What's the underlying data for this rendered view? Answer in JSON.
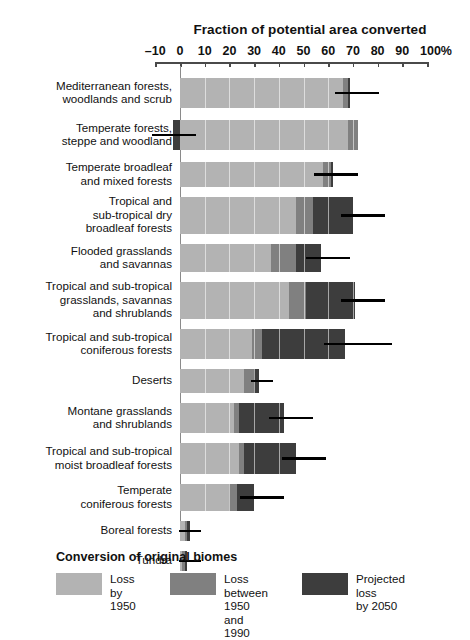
{
  "chart_data": {
    "type": "bar",
    "orientation": "horizontal",
    "stacked": true,
    "title": "Fraction of potential area converted",
    "xlabel": "",
    "ylabel": "",
    "xlim": [
      -10,
      100
    ],
    "xtick_labels": [
      "–10",
      "0",
      "10",
      "20",
      "30",
      "40",
      "50",
      "60",
      "70",
      "80",
      "90",
      "100%"
    ],
    "xtick_values": [
      -10,
      0,
      10,
      20,
      30,
      40,
      50,
      60,
      70,
      80,
      90,
      100
    ],
    "grid": false,
    "legend_position": "bottom",
    "legend_title": "Conversion of original biomes",
    "series": [
      {
        "name": "Loss by\n1950",
        "color": "#b3b3b3",
        "values": [
          66,
          68,
          58,
          47,
          37,
          44,
          29,
          26,
          22,
          24,
          20,
          2,
          1
        ]
      },
      {
        "name": "Loss between\n1950 and 1990",
        "color": "#808080",
        "values": [
          2,
          4,
          3,
          7,
          10,
          7,
          4,
          4,
          2,
          2,
          3,
          1,
          1
        ]
      },
      {
        "name": "Projected loss\nby 2050",
        "color": "#3d3d3d",
        "values": [
          1,
          -3,
          1,
          16,
          10,
          20,
          34,
          2,
          18,
          21,
          7,
          1,
          1
        ]
      }
    ],
    "categories": [
      "Mediterranean forests,\nwoodlands and scrub",
      "Temperate forests,\nsteppe and woodland",
      "Temperate broadleaf\nand mixed forests",
      "Tropical and\nsub-tropical dry\nbroadleaf forests",
      "Flooded grasslands\nand savannas",
      "Tropical and sub-tropical\ngrasslands, savannas\nand shrublands",
      "Tropical and sub-tropical\nconiferous forests",
      "Deserts",
      "Montane grasslands\nand shrublands",
      "Tropical and sub-tropical\nmoist broadleaf forests",
      "Temperate\nconiferous forests",
      "Boreal forests",
      "Tundra"
    ],
    "error_markers": [
      {
        "category": "Mediterranean forests, woodlands and scrub",
        "x": 71.5
      },
      {
        "category": "Temperate forests, steppe and woodland",
        "x": -2.5
      },
      {
        "category": "Temperate broadleaf and mixed forests",
        "x": 63
      },
      {
        "category": "Tropical and sub-tropical dry broadleaf forests",
        "x": 74
      },
      {
        "category": "Flooded grasslands and savannas",
        "x": 60
      },
      {
        "category": "Tropical and sub-tropical grasslands, savannas and shrublands",
        "x": 74
      },
      {
        "category": "Tropical and sub-tropical coniferous forests",
        "x": 72
      },
      {
        "category": "Deserts",
        "x": 33
      },
      {
        "category": "Montane grasslands and shrublands",
        "x": 45
      },
      {
        "category": "Tropical and sub-tropical moist broadleaf forests",
        "x": 50
      },
      {
        "category": "Temperate coniferous forests",
        "x": 33
      },
      {
        "category": "Boreal forests",
        "x": 4
      },
      {
        "category": "Tundra",
        "x": 4
      }
    ]
  },
  "legend": {
    "title": "Conversion of original biomes",
    "entries": [
      {
        "label": "Loss by\n1950",
        "color": "#b3b3b3"
      },
      {
        "label": "Loss between\n1950 and 1990",
        "color": "#808080"
      },
      {
        "label": "Projected loss\nby 2050",
        "color": "#3d3d3d"
      }
    ]
  },
  "colors": {
    "loss_by_1950": "#b3b3b3",
    "loss_1950_1990": "#808080",
    "projected_loss_2050": "#3d3d3d",
    "axis": "#4a4a4a",
    "text": "#111111",
    "background": "#ffffff"
  }
}
